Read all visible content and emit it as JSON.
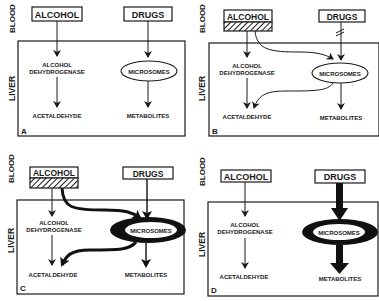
{
  "figure": {
    "labels": {
      "blood": "BLOOD",
      "liver": "LIVER",
      "alcohol": "ALCOHOL",
      "drugs": "DRUGS",
      "alcohol_dehydrogenase_line1": "ALCOHOL",
      "alcohol_dehydrogenase_line2": "DEHYDROGENASE",
      "microsomes": "MICROSOMES",
      "acetaldehyde": "ACETALDEHYDE",
      "metabolites": "METABOLITES"
    },
    "panels": [
      {
        "id": "A",
        "letter": "A",
        "description": "Baseline: alcohol via alcohol dehydrogenase, drugs via microsomes"
      },
      {
        "id": "B",
        "letter": "B",
        "description": "Acute alcohol: alcohol also metabolized by microsomes; drug metabolism inhibited"
      },
      {
        "id": "C",
        "letter": "C",
        "description": "Chronic alcohol: induced microsomes metabolize more alcohol and drugs"
      },
      {
        "id": "D",
        "letter": "D",
        "description": "After alcohol withdrawal: induced microsomes, increased drug metabolism"
      }
    ],
    "colors": {
      "ink": "#1a1a1a",
      "background": "#ffffff"
    }
  }
}
